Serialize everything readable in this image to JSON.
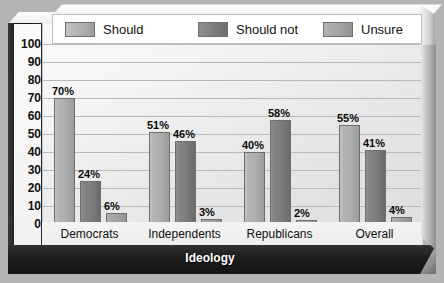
{
  "chart_data": {
    "type": "bar",
    "title": "",
    "xlabel": "Ideology",
    "ylabel": "Percent",
    "ylim": [
      0,
      100
    ],
    "ytick_step": 10,
    "ytick_labels": [
      "100",
      "90",
      "80",
      "70",
      "60",
      "50",
      "40",
      "30",
      "20",
      "10",
      "0"
    ],
    "grid": true,
    "legend_position": "top",
    "categories": [
      "Democrats",
      "Independents",
      "Republicans",
      "Overall"
    ],
    "series": [
      {
        "name": "Should",
        "color": "#aeaeae",
        "values": [
          70,
          51,
          40,
          55
        ],
        "labels": [
          "70%",
          "51%",
          "40%",
          "55%"
        ]
      },
      {
        "name": "Should not",
        "color": "#7c7c7c",
        "values": [
          24,
          46,
          58,
          41
        ],
        "labels": [
          "24%",
          "46%",
          "58%",
          "41%"
        ]
      },
      {
        "name": "Unsure",
        "color": "#a2a2a2",
        "values": [
          6,
          3,
          2,
          4
        ],
        "labels": [
          "6%",
          "3%",
          "2%",
          "4%"
        ]
      }
    ]
  },
  "axes": {
    "y_title": "Percent",
    "x_title": "Ideology"
  },
  "legend": {
    "entries": [
      {
        "label": "Should",
        "swatch": "#aeaeae"
      },
      {
        "label": "Should not",
        "swatch": "#7c7c7c"
      },
      {
        "label": "Unsure",
        "swatch": "#a2a2a2"
      }
    ]
  },
  "colors": {
    "panel_background": "#f3f3f3",
    "axis_band": "#141414",
    "gridline": "#b9b9b9",
    "page_background": "#b4b4b4"
  }
}
